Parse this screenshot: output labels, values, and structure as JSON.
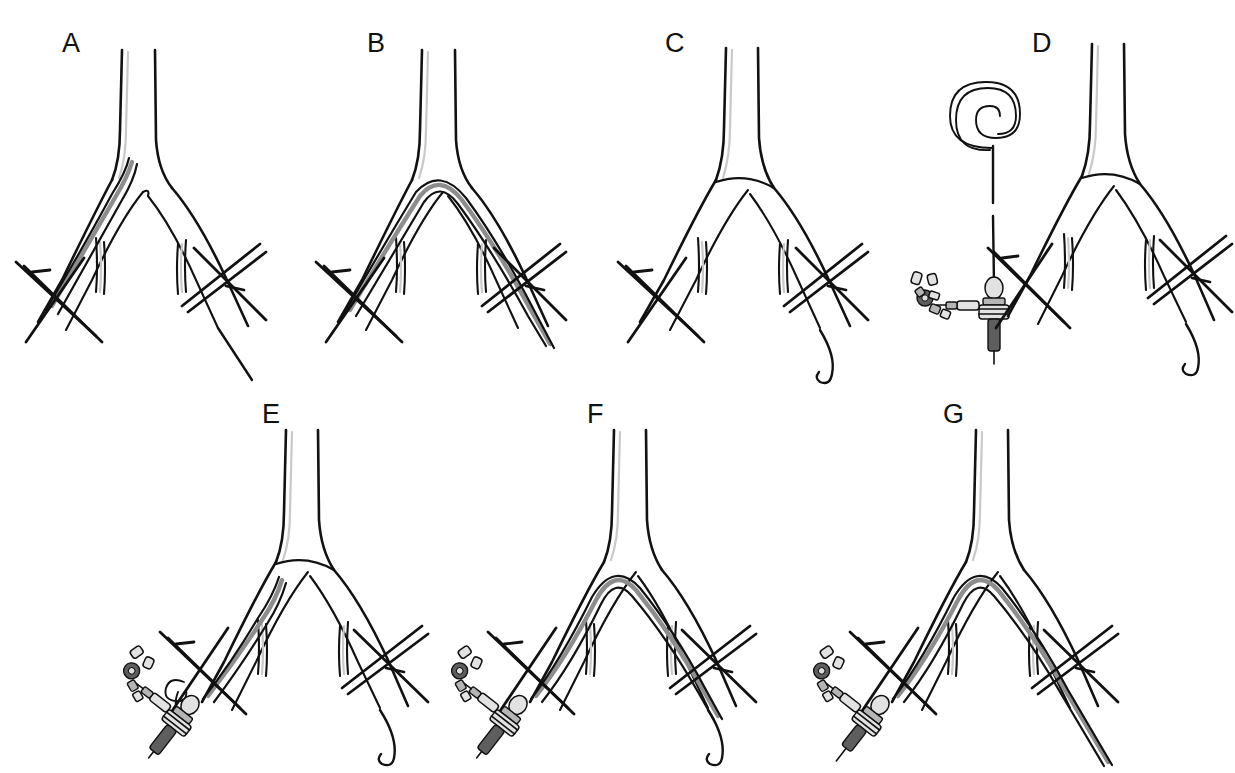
{
  "figure": {
    "background_color": "#ffffff",
    "width": 1235,
    "height": 773,
    "rows": 2,
    "panel_count": 7
  },
  "colors": {
    "ink": "#111111",
    "vessel_shadow": "#c9c9c9",
    "catheter_gray": "#8d8d8d",
    "device_light": "#e2e2e2",
    "device_mid": "#b5b5b5",
    "device_dark": "#5e5e5e",
    "paper": "#ffffff"
  },
  "panels": [
    {
      "id": "A",
      "label": "A",
      "label_x": 62,
      "label_y": 30,
      "row": 1,
      "anatomy": "aorto-iliac bifurcation",
      "catheter_visible": true,
      "catheter_path": "left-iliac-through-bifurcation-into-aorta",
      "device_visible": false,
      "coil_visible": false,
      "vessel_loops": 2,
      "free_wire_tail": "right-iliac-straight"
    },
    {
      "id": "B",
      "label": "B",
      "label_x": 367,
      "label_y": 30,
      "row": 1,
      "anatomy": "aorto-iliac bifurcation",
      "catheter_visible": true,
      "catheter_path": "left-iliac-across-bifurcation-into-right-iliac",
      "device_visible": false,
      "coil_visible": false,
      "vessel_loops": 2,
      "free_wire_tail": "right-iliac-straight"
    },
    {
      "id": "C",
      "label": "C",
      "label_x": 665,
      "label_y": 30,
      "row": 1,
      "anatomy": "aorto-iliac bifurcation",
      "catheter_visible": false,
      "catheter_path": "none",
      "device_visible": false,
      "coil_visible": false,
      "vessel_loops": 2,
      "free_wire_tail": "right-iliac-curled"
    },
    {
      "id": "D",
      "label": "D",
      "label_x": 1032,
      "label_y": 30,
      "row": 1,
      "anatomy": "aorto-iliac bifurcation",
      "catheter_visible": false,
      "catheter_path": "none",
      "device_visible": true,
      "device_name": "hemostatic-valve-with-stopcock",
      "device_orientation": "vertical",
      "coil_visible": true,
      "coil_turns": 2,
      "vessel_loops": 2,
      "free_wire_tail": "right-iliac-curled"
    },
    {
      "id": "E",
      "label": "E",
      "label_x": 262,
      "label_y": 401,
      "row": 2,
      "anatomy": "aorto-iliac bifurcation",
      "catheter_visible": true,
      "catheter_path": "left-iliac-partial-to-bifurcation",
      "device_visible": true,
      "device_name": "hemostatic-valve-with-stopcock",
      "device_orientation": "oblique",
      "coil_visible": true,
      "coil_turns": 1,
      "vessel_loops": 2,
      "free_wire_tail": "right-iliac-curled"
    },
    {
      "id": "F",
      "label": "F",
      "label_x": 587,
      "label_y": 401,
      "row": 2,
      "anatomy": "aorto-iliac bifurcation",
      "catheter_visible": true,
      "catheter_path": "left-iliac-over-bifurcation-into-right-iliac",
      "device_visible": true,
      "device_name": "hemostatic-valve-with-stopcock",
      "device_orientation": "oblique",
      "coil_visible": false,
      "vessel_loops": 2,
      "free_wire_tail": "right-iliac-curled"
    },
    {
      "id": "G",
      "label": "G",
      "label_x": 943,
      "label_y": 401,
      "row": 2,
      "anatomy": "aorto-iliac bifurcation",
      "catheter_visible": true,
      "catheter_path": "left-iliac-over-bifurcation-exits-right-iliac",
      "device_visible": true,
      "device_name": "hemostatic-valve-with-stopcock",
      "device_orientation": "oblique",
      "coil_visible": false,
      "vessel_loops": 2,
      "free_wire_tail": "right-iliac-straight-long"
    }
  ],
  "legend_parts": {
    "aorta": "aorta",
    "left_iliac": "left common iliac artery",
    "right_iliac": "right common iliac artery",
    "internal_iliac": "internal iliac artery stump",
    "vessel_loop": "vessel loop / elastic snare",
    "guidewire": "guidewire",
    "sheath": "introducer sheath",
    "stopcock": "three-way stopcock",
    "valve": "hemostatic valve"
  }
}
